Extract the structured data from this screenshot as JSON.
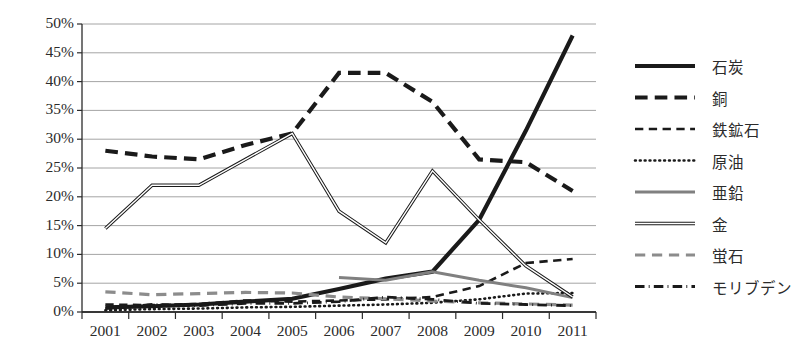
{
  "chart_data": {
    "type": "line",
    "title": "",
    "xlabel": "",
    "ylabel": "",
    "categories": [
      "2001",
      "2002",
      "2003",
      "2004",
      "2005",
      "2006",
      "2007",
      "2008",
      "2009",
      "2010",
      "2011"
    ],
    "ylim": [
      0,
      50
    ],
    "ytick_labels": [
      "0%",
      "5%",
      "10%",
      "15%",
      "20%",
      "25%",
      "30%",
      "35%",
      "40%",
      "45%",
      "50%"
    ],
    "ytick_values": [
      0,
      5,
      10,
      15,
      20,
      25,
      30,
      35,
      40,
      45,
      50
    ],
    "grid": true,
    "legend_position": "right",
    "series": [
      {
        "name": "石炭",
        "style": "solid-thick",
        "color": "#1a1a1a",
        "width": 4.2,
        "values": [
          0.8,
          1.0,
          1.3,
          1.8,
          2.3,
          4.0,
          5.8,
          7.0,
          16.0,
          31.5,
          48.0
        ]
      },
      {
        "name": "銅",
        "style": "dash-thick",
        "color": "#1a1a1a",
        "width": 4.2,
        "values": [
          28.0,
          27.0,
          26.5,
          29.0,
          31.0,
          41.5,
          41.5,
          36.5,
          26.5,
          26.0,
          21.0
        ]
      },
      {
        "name": "鉄鉱石",
        "style": "dash",
        "color": "#1a1a1a",
        "width": 2.6,
        "values": [
          1.3,
          1.2,
          1.4,
          2.0,
          1.8,
          2.0,
          2.2,
          2.6,
          4.5,
          8.5,
          9.2
        ]
      },
      {
        "name": "原油",
        "style": "dotted",
        "color": "#1a1a1a",
        "width": 2.6,
        "values": [
          0.3,
          0.5,
          0.6,
          0.8,
          0.9,
          1.1,
          1.3,
          1.6,
          2.2,
          3.2,
          3.3
        ]
      },
      {
        "name": "亜鉛",
        "style": "solid",
        "color": "#808080",
        "width": 3.0,
        "values": [
          null,
          null,
          null,
          null,
          null,
          6.0,
          5.5,
          7.0,
          5.5,
          4.2,
          2.5
        ]
      },
      {
        "name": "金",
        "style": "double",
        "color": "#1a1a1a",
        "width": 3.4,
        "values": [
          14.5,
          22.0,
          22.0,
          26.5,
          31.0,
          17.5,
          12.0,
          24.5,
          16.0,
          8.0,
          2.6
        ]
      },
      {
        "name": "蛍石",
        "style": "dash",
        "color": "#8c8c8c",
        "width": 3.2,
        "values": [
          3.5,
          3.0,
          3.2,
          3.4,
          3.3,
          2.6,
          2.3,
          1.9,
          1.6,
          1.4,
          1.2
        ]
      },
      {
        "name": "モリブデン",
        "style": "dashdot",
        "color": "#1a1a1a",
        "width": 2.8,
        "values": [
          0.6,
          1.3,
          1.1,
          1.5,
          1.5,
          1.8,
          2.6,
          2.2,
          1.5,
          1.3,
          1.1
        ]
      }
    ]
  },
  "legend": {
    "items": [
      {
        "label": "石炭"
      },
      {
        "label": "銅"
      },
      {
        "label": "鉄鉱石"
      },
      {
        "label": "原油"
      },
      {
        "label": "亜鉛"
      },
      {
        "label": "金"
      },
      {
        "label": "蛍石"
      },
      {
        "label": "モリブデン"
      }
    ]
  }
}
